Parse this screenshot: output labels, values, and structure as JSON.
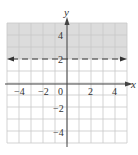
{
  "chart_data": {
    "type": "inequality-graph",
    "title": "",
    "inequality": "y > 2",
    "boundary": {
      "equation": "y = 2",
      "style": "dashed",
      "y": 2
    },
    "shaded_region": "above boundary (y > 2)",
    "xlabel": "x",
    "ylabel": "y",
    "xlim": [
      -5,
      5
    ],
    "ylim": [
      -5,
      5
    ],
    "grid": true,
    "grid_step": 1,
    "x_ticks": [
      -4,
      -2,
      0,
      2,
      4
    ],
    "y_ticks": [
      4,
      2,
      -2,
      -4
    ],
    "x_tick_labels": [
      "−4",
      "−2",
      "0",
      "2",
      "4"
    ],
    "y_tick_labels": [
      "4",
      "2",
      "−2",
      "−4"
    ]
  },
  "colors": {
    "shade": "#dcdcdc",
    "grid": "#c8c8c8",
    "axis": "#444444",
    "boundary": "#333333"
  },
  "labels": {
    "x_axis": "x",
    "y_axis": "y"
  }
}
